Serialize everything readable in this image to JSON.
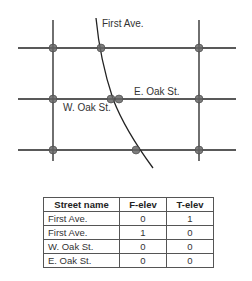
{
  "diagram": {
    "labels": {
      "first_ave": "First Ave.",
      "e_oak": "E. Oak St.",
      "w_oak": "W. Oak St."
    },
    "colors": {
      "line": "#222222",
      "node": "#555555"
    }
  },
  "table": {
    "headers": [
      "Street name",
      "F-elev",
      "T-elev"
    ],
    "rows": [
      [
        "First Ave.",
        "0",
        "1"
      ],
      [
        "First Ave.",
        "1",
        "0"
      ],
      [
        "W. Oak St.",
        "0",
        "0"
      ],
      [
        "E. Oak St.",
        "0",
        "0"
      ]
    ]
  }
}
